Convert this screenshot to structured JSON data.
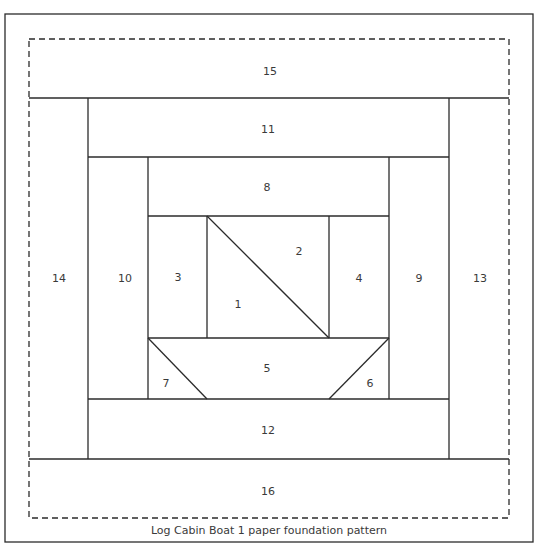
{
  "caption": "Log Cabin Boat 1 paper foundation pattern",
  "colors": {
    "line": "#2b2b2b",
    "text": "#3a3a3a",
    "background": "#ffffff"
  },
  "pieces": [
    {
      "id": "1",
      "label": "1",
      "x": 238,
      "y": 305
    },
    {
      "id": "2",
      "label": "2",
      "x": 299,
      "y": 252
    },
    {
      "id": "3",
      "label": "3",
      "x": 178,
      "y": 278
    },
    {
      "id": "4",
      "label": "4",
      "x": 359,
      "y": 279
    },
    {
      "id": "5",
      "label": "5",
      "x": 267,
      "y": 369
    },
    {
      "id": "6",
      "label": "6",
      "x": 370,
      "y": 384
    },
    {
      "id": "7",
      "label": "7",
      "x": 166,
      "y": 384
    },
    {
      "id": "8",
      "label": "8",
      "x": 267,
      "y": 188
    },
    {
      "id": "9",
      "label": "9",
      "x": 419,
      "y": 279
    },
    {
      "id": "10",
      "label": "10",
      "x": 125,
      "y": 279
    },
    {
      "id": "11",
      "label": "11",
      "x": 268,
      "y": 130
    },
    {
      "id": "12",
      "label": "12",
      "x": 268,
      "y": 431
    },
    {
      "id": "13",
      "label": "13",
      "x": 480,
      "y": 279
    },
    {
      "id": "14",
      "label": "14",
      "x": 59,
      "y": 279
    },
    {
      "id": "15",
      "label": "15",
      "x": 270,
      "y": 72
    },
    {
      "id": "16",
      "label": "16",
      "x": 268,
      "y": 492
    }
  ]
}
